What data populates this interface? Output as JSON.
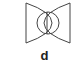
{
  "figure": {
    "panel_label": "d",
    "stroke_color": "#444444",
    "background": "#ffffff",
    "shapes": [
      "left-vertical-line",
      "left-arc",
      "center-circle",
      "center-line",
      "right-arc",
      "right-vertical-line"
    ]
  }
}
